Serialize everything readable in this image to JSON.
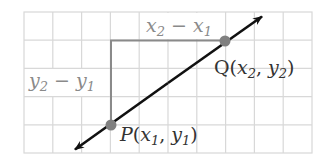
{
  "diagram": {
    "type": "slope-on-grid",
    "grid": {
      "x0": 24,
      "y0": 12,
      "x1": 312,
      "y1": 153,
      "columns": 10,
      "rows": 5,
      "line_color": "#d8d8d8"
    },
    "points": {
      "P": {
        "label_name": "P",
        "coords": [
          "x",
          "1",
          "y",
          "1"
        ],
        "x": 111,
        "y": 125,
        "color": "#808080"
      },
      "Q": {
        "label_name": "Q",
        "coords": [
          "x",
          "2",
          "y",
          "2"
        ],
        "x": 225,
        "y": 41,
        "color": "#808080"
      }
    },
    "line": {
      "start": [
        73,
        151
      ],
      "end": [
        264,
        15
      ],
      "color": "#111111",
      "arrows": "both"
    },
    "rise_run_path": {
      "color": "#8a8a8a"
    },
    "labels": {
      "run": {
        "a": "x",
        "a_sub": "2",
        "op": "−",
        "b": "x",
        "b_sub": "1",
        "color": "#8a8a8a"
      },
      "rise": {
        "a": "y",
        "a_sub": "2",
        "op": "−",
        "b": "y",
        "b_sub": "1",
        "color": "#8a8a8a"
      },
      "P": {
        "name": "P",
        "open": "(",
        "v1": "x",
        "v1_sub": "1",
        "sep": ", ",
        "v2": "y",
        "v2_sub": "1",
        "close": ")",
        "color": "#333333"
      },
      "Q": {
        "name": "Q",
        "open": "(",
        "v1": "x",
        "v1_sub": "2",
        "sep": ", ",
        "v2": "y",
        "v2_sub": "2",
        "close": ")",
        "color": "#333333"
      }
    }
  }
}
